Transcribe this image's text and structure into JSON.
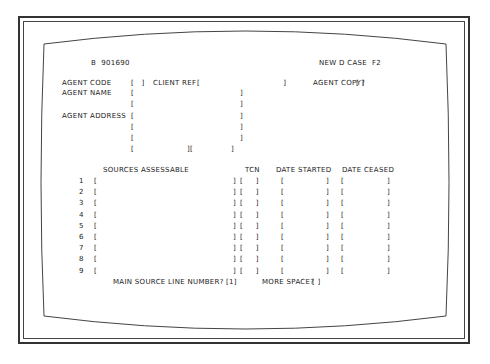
{
  "header": {
    "record_id": "B  901690",
    "mode": "NEW D CASE  F2"
  },
  "agent": {
    "code_label": "AGENT CODE",
    "code_value": "",
    "client_ref_label": "CLIENT REF",
    "client_ref_value": "",
    "copy_label": "AGENT COPY?",
    "copy_value": "",
    "name_label": "AGENT NAME",
    "address_label": "AGENT ADDRESS"
  },
  "sources": {
    "headers": {
      "sources": "SOURCES ASSESSABLE",
      "tcn": "TCN",
      "started": "DATE STARTED",
      "ceased": "DATE CEASED"
    },
    "rows": [
      {
        "num": "1"
      },
      {
        "num": "2"
      },
      {
        "num": "3"
      },
      {
        "num": "4"
      },
      {
        "num": "5"
      },
      {
        "num": "6"
      },
      {
        "num": "7"
      },
      {
        "num": "8"
      },
      {
        "num": "9"
      }
    ]
  },
  "footer": {
    "main_source_label": "MAIN SOURCE LINE NUMBER?",
    "main_source_value": "1",
    "more_space_label": "MORE SPACE?",
    "more_space_value": ""
  }
}
